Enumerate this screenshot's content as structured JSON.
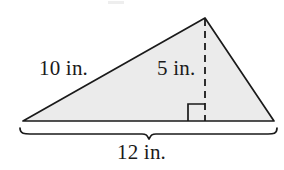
{
  "figure": {
    "kind": "geometry-diagram",
    "shape": "triangle",
    "background_color": "#ffffff",
    "fill_color": "#ebebeb",
    "stroke_color": "#1a1a1a"
  },
  "labels": {
    "slant_side": "10 in.",
    "height": "5 in.",
    "base": "12 in."
  },
  "measurements": {
    "slant_side_value": 10,
    "height_value": 5,
    "base_value": 12,
    "units": "in."
  },
  "annotations": {
    "right_angle_marker": "right-angle-square",
    "altitude_line_style": "dashed",
    "base_brace": "curly-brace-below-base"
  },
  "geometry": {
    "left_vertex": [
      23,
      121
    ],
    "apex": [
      205,
      18
    ],
    "right_vertex": [
      274,
      121
    ],
    "altitude_foot": [
      205,
      121
    ]
  }
}
